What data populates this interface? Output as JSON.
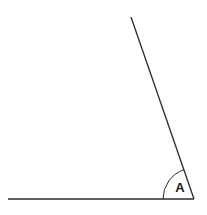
{
  "diagram": {
    "type": "angle",
    "angle_label": "A",
    "stroke_color": "#2a2a2a",
    "background": "#ffffff",
    "vertex": {
      "x": 194,
      "y": 199
    },
    "rays": [
      {
        "name": "horizontal-ray",
        "end": {
          "x": 8,
          "y": 199
        }
      },
      {
        "name": "slanted-ray",
        "end": {
          "x": 131,
          "y": 17
        }
      }
    ],
    "arc_radius": 31
  }
}
